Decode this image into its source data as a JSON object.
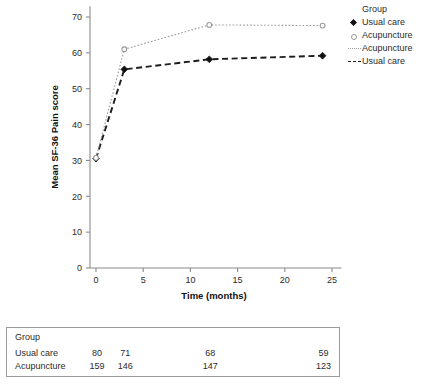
{
  "chart_data": {
    "type": "line",
    "title": "",
    "xlabel": "Time (months)",
    "ylabel": "Mean SF-36 Pain score",
    "x": [
      0,
      3,
      12,
      24
    ],
    "xlim": [
      -1.5,
      26
    ],
    "ylim": [
      0,
      73
    ],
    "xticks": [
      0,
      5,
      10,
      15,
      20,
      25
    ],
    "xticklabels": [
      "0",
      "5",
      "10",
      "15",
      "20",
      "25"
    ],
    "yticks": [
      0,
      10,
      20,
      30,
      40,
      50,
      60,
      70
    ],
    "yticklabels": [
      "0",
      "10",
      "20",
      "30",
      "40",
      "50",
      "60",
      "70"
    ],
    "grid": false,
    "legend_position": "right",
    "series": [
      {
        "name": "Usual care",
        "values": [
          30.5,
          55.4,
          58.2,
          59.2
        ],
        "marker": "filled-diamond",
        "linestyle": "dashed",
        "color": "#1d1d1d"
      },
      {
        "name": "Acupuncture",
        "values": [
          30.7,
          61.0,
          67.8,
          67.6
        ],
        "marker": "open-circle",
        "linestyle": "dotted",
        "color": "#9a9a9a"
      }
    ]
  },
  "legend": {
    "title": "Group",
    "entries": [
      {
        "label": "Usual care",
        "key": "filled-diamond-marker"
      },
      {
        "label": "Acupuncture",
        "key": "open-circle-marker"
      },
      {
        "label": "Acupuncture",
        "key": "dotted-line"
      },
      {
        "label": "Usual care",
        "key": "dashed-line"
      }
    ]
  },
  "risk_table": {
    "title": "Group",
    "columns": [
      0,
      3,
      12,
      24
    ],
    "rows": [
      {
        "label": "Usual care",
        "values": [
          "80",
          "71",
          "68",
          "59"
        ]
      },
      {
        "label": "Acupuncture",
        "values": [
          "159",
          "146",
          "147",
          "123"
        ]
      }
    ]
  }
}
